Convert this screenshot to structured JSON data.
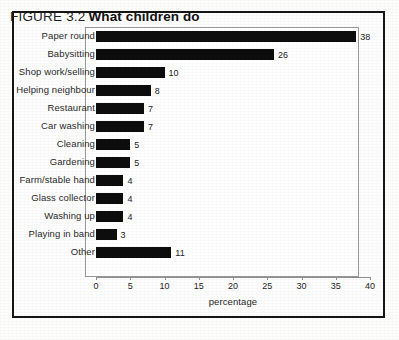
{
  "figure": {
    "number_label": "FIGURE 3.2",
    "title": "What children do"
  },
  "chart_data": {
    "type": "bar",
    "orientation": "horizontal",
    "title": "What children do",
    "xlabel": "percentage",
    "ylabel": "",
    "xlim": [
      0,
      40
    ],
    "xticks": [
      0,
      5,
      10,
      15,
      20,
      25,
      30,
      35,
      40
    ],
    "xtick_labels": [
      "0",
      "5",
      "10",
      "15",
      "20",
      "25",
      "30",
      "35",
      "40"
    ],
    "grid": false,
    "legend": false,
    "bar_color": "#0d0d0d",
    "categories": [
      "Paper round",
      "Babysitting",
      "Shop work/selling",
      "Helping neighbour",
      "Restaurant",
      "Car washing",
      "Cleaning",
      "Gardening",
      "Farm/stable hand",
      "Glass collector",
      "Washing up",
      "Playing in band",
      "Other"
    ],
    "values": [
      38,
      26,
      10,
      8,
      7,
      7,
      5,
      5,
      4,
      4,
      4,
      3,
      11
    ],
    "data_labels": [
      "38",
      "26",
      "10",
      "8",
      "7",
      "7",
      "5",
      "5",
      "4",
      "4",
      "4",
      "3",
      "11"
    ]
  }
}
